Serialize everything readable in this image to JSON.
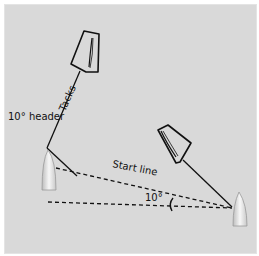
{
  "diagram": {
    "labels": {
      "tacks": "Tacks",
      "header": "10° header",
      "start_line": "Start line",
      "angle": "10°"
    },
    "colors": {
      "background": "#d9d9d9",
      "line": "#111111",
      "hull": "#eeeeee"
    }
  }
}
